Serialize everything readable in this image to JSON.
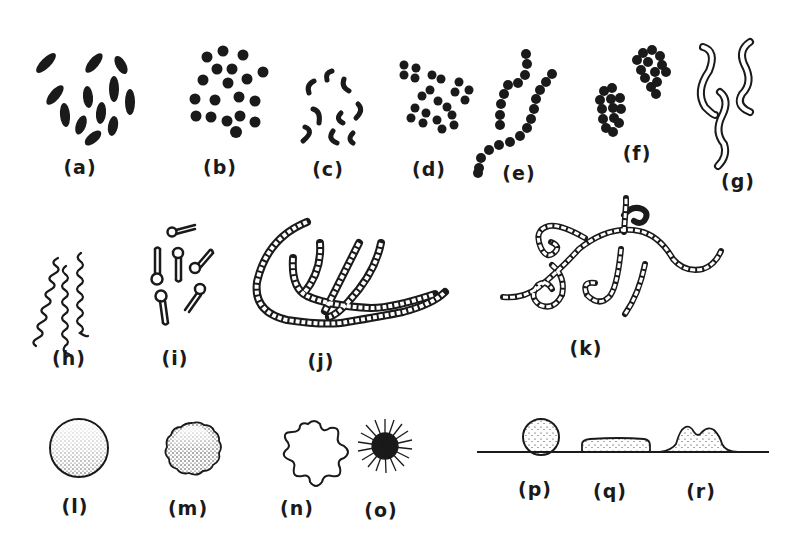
{
  "figure": {
    "ink_color": "#1a1a1a",
    "background": "#ffffff",
    "panels": [
      {
        "id": "a",
        "label": "(a)",
        "description": "rod-shaped bacilli, scattered"
      },
      {
        "id": "b",
        "label": "(b)",
        "description": "cocci, scattered"
      },
      {
        "id": "c",
        "label": "(c)",
        "description": "comma-shaped vibrios"
      },
      {
        "id": "d",
        "label": "(d)",
        "description": "diplococci (pairs)"
      },
      {
        "id": "e",
        "label": "(e)",
        "description": "streptococci (chains)"
      },
      {
        "id": "f",
        "label": "(f)",
        "description": "staphylococci (grape-like clusters)"
      },
      {
        "id": "g",
        "label": "(g)",
        "description": "spirilla (outlined curved rods)"
      },
      {
        "id": "h",
        "label": "(h)",
        "description": "spirochetes (wavy threads)"
      },
      {
        "id": "i",
        "label": "(i)",
        "description": "spore-forming rods (terminal spores)"
      },
      {
        "id": "j",
        "label": "(j)",
        "description": "branching segmented filaments"
      },
      {
        "id": "k",
        "label": "(k)",
        "description": "branched filaments with coils"
      },
      {
        "id": "l",
        "label": "(l)",
        "description": "circular colony, smooth edge, stippled"
      },
      {
        "id": "m",
        "label": "(m)",
        "description": "circular colony, rough edge, stippled"
      },
      {
        "id": "n",
        "label": "(n)",
        "description": "undulate colony margin"
      },
      {
        "id": "o",
        "label": "(o)",
        "description": "filamentous / radiating colony"
      },
      {
        "id": "p",
        "label": "(p)",
        "description": "colony elevation: convex / pulvinate"
      },
      {
        "id": "q",
        "label": "(q)",
        "description": "colony elevation: flat / raised"
      },
      {
        "id": "r",
        "label": "(r)",
        "description": "colony elevation: umbonate / irregular"
      }
    ]
  }
}
